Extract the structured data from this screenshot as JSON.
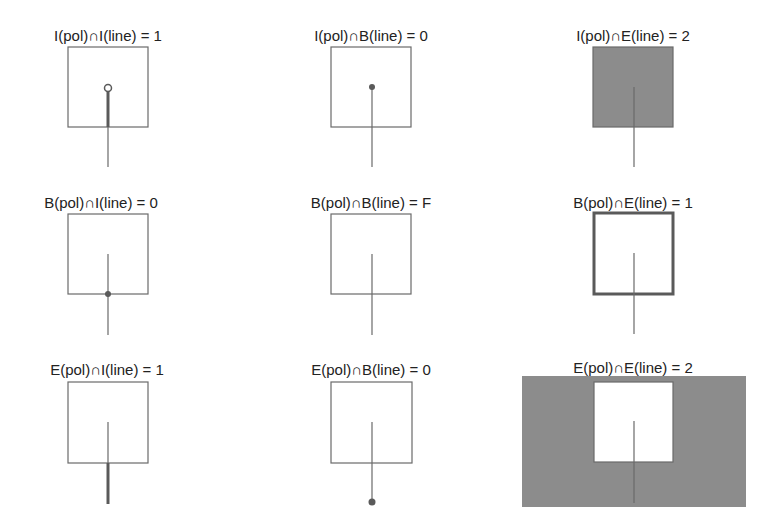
{
  "colors": {
    "stroke": "#6a6a6a",
    "highlight": "#5a5a5a",
    "fill": "#8c8c8c",
    "text": "#222222"
  },
  "cells": [
    {
      "label": "I(pol)∩I(line) = 1",
      "row": 0,
      "col": 0,
      "highlight": "line-interior-inside"
    },
    {
      "label": "I(pol)∩B(line) = 0",
      "row": 0,
      "col": 1,
      "highlight": "inner-endpoint"
    },
    {
      "label": "I(pol)∩E(line) = 2",
      "row": 0,
      "col": 2,
      "highlight": "polygon-interior"
    },
    {
      "label": "B(pol)∩I(line) = 0",
      "row": 1,
      "col": 0,
      "highlight": "boundary-crossing-point"
    },
    {
      "label": "B(pol)∩B(line) = F",
      "row": 1,
      "col": 1,
      "highlight": "none"
    },
    {
      "label": "B(pol)∩E(line) = 1",
      "row": 1,
      "col": 2,
      "highlight": "polygon-boundary"
    },
    {
      "label": "E(pol)∩I(line) = 1",
      "row": 2,
      "col": 0,
      "highlight": "line-interior-outside"
    },
    {
      "label": "E(pol)∩B(line) = 0",
      "row": 2,
      "col": 1,
      "highlight": "outer-endpoint"
    },
    {
      "label": "E(pol)∩E(line) = 2",
      "row": 2,
      "col": 2,
      "highlight": "polygon-exterior"
    }
  ]
}
